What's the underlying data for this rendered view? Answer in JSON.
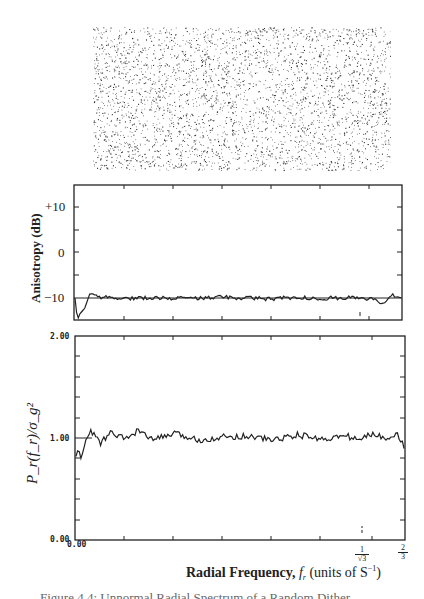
{
  "figure": {
    "dot_pattern": {
      "name": "random-dither-pattern",
      "density": 0.22
    },
    "caption": "Figure 4.4: Unnormal Radial Spectrum of a Random Dither"
  },
  "chart_data": [
    {
      "type": "line",
      "title": "",
      "ylabel": "Anisotropy (dB)",
      "xlabel": "",
      "yticks": [
        "+10",
        "0",
        "−10"
      ],
      "ylim": [
        -15,
        15
      ],
      "reference_line": -10,
      "x_range": [
        0,
        0.6667
      ],
      "description": "Anisotropy fluctuates near -10 dB across all radial frequencies, with a dip to about -15 dB at the lowest frequencies.",
      "series": [
        {
          "name": "anisotropy",
          "x": [
            0.0,
            0.005,
            0.01,
            0.02,
            0.03,
            0.05,
            0.1,
            0.15,
            0.2,
            0.25,
            0.3,
            0.35,
            0.4,
            0.45,
            0.5,
            0.55,
            0.577,
            0.6,
            0.63,
            0.65,
            0.6667
          ],
          "values": [
            -10,
            -14.8,
            -13.5,
            -12.2,
            -9.2,
            -9.8,
            -10.1,
            -9.9,
            -10.0,
            -10.1,
            -9.8,
            -10.0,
            -10.2,
            -9.9,
            -10.1,
            -9.9,
            -10.0,
            -10.2,
            -11,
            -9.3,
            -9.6
          ]
        }
      ]
    },
    {
      "type": "line",
      "title": "",
      "ylabel": "P_r(f_r)/σ_g²",
      "xlabel": "Radial Frequency, f_r (units of S⁻¹)",
      "yticks": [
        "2.00",
        "1.00",
        "0.00"
      ],
      "ylim": [
        0.0,
        2.0
      ],
      "reference_line": 1.0,
      "xticks": [
        "0.00",
        "1/√3",
        "2/3"
      ],
      "x_range": [
        0,
        0.6667
      ],
      "description": "Normalized radial power spectrum is flat near 1.0 (white noise) with lower values near zero frequency.",
      "series": [
        {
          "name": "radial power",
          "x": [
            0.0,
            0.005,
            0.01,
            0.015,
            0.02,
            0.03,
            0.04,
            0.05,
            0.07,
            0.1,
            0.13,
            0.15,
            0.2,
            0.25,
            0.3,
            0.35,
            0.4,
            0.45,
            0.5,
            0.55,
            0.577,
            0.6,
            0.63,
            0.65,
            0.6667
          ],
          "values": [
            0.82,
            0.9,
            0.8,
            0.88,
            0.98,
            1.06,
            1.02,
            0.95,
            1.05,
            0.99,
            1.08,
            0.98,
            1.04,
            0.98,
            1.01,
            1.02,
            0.98,
            1.03,
            0.99,
            1.02,
            0.98,
            1.04,
            1.0,
            1.05,
            0.92
          ]
        }
      ]
    }
  ],
  "labels": {
    "anis_ylabel": "Anisotropy (dB)",
    "anis_t10": "+10",
    "anis_t0": "0",
    "anis_tm10": "−10",
    "spec_t2": "2.00",
    "spec_t1": "1.00",
    "spec_t0": "0.00",
    "spec_x0": "0.00",
    "frac1_num": "1",
    "frac1_den": "√3",
    "frac2_num": "2",
    "frac2_den": "3",
    "xlabel_bold": "Radial Frequency,",
    "xlabel_var": "f",
    "xlabel_sub": "r",
    "xlabel_units": "(units of S",
    "xlabel_sup": "−1",
    "xlabel_close": ")"
  }
}
